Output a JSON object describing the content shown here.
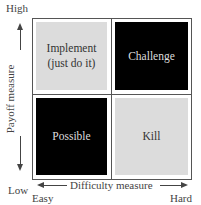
{
  "diagram": {
    "type": "2x2 matrix",
    "y_axis": {
      "label": "Payoff measure",
      "high": "High",
      "low": "Low"
    },
    "x_axis": {
      "label": "Difficulty measure",
      "low": "Easy",
      "high": "Hard"
    },
    "quadrants": {
      "top_left": {
        "label_line1": "Implement",
        "label_line2": "(just do it)",
        "fill": "#dcdcdc"
      },
      "top_right": {
        "label": "Challenge",
        "fill": "#000000"
      },
      "bottom_left": {
        "label": "Possible",
        "fill": "#000000"
      },
      "bottom_right": {
        "label": "Kill",
        "fill": "#dcdcdc"
      }
    }
  }
}
